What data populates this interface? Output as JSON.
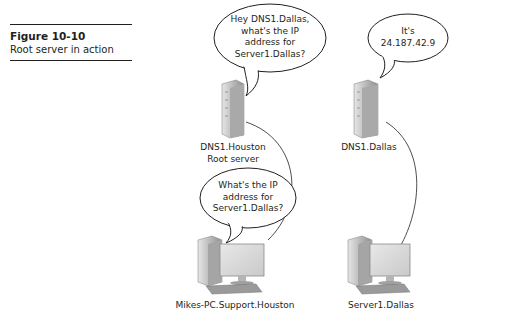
{
  "figure": {
    "number": "Figure 10-10",
    "title": "Root server in action"
  },
  "nodes": {
    "dns_houston": {
      "label_line1": "DNS1.Houston",
      "label_line2": "Root server",
      "type": "server-tower"
    },
    "dns_dallas": {
      "label": "DNS1.Dallas",
      "type": "server-tower"
    },
    "mikes_pc": {
      "label": "Mikes-PC.Support.Houston",
      "type": "desktop-computer"
    },
    "server_dallas": {
      "label": "Server1.Dallas",
      "type": "desktop-computer"
    }
  },
  "bubbles": {
    "houston_query": {
      "lines": [
        "Hey DNS1.Dallas,",
        "what's the IP",
        "address for",
        "Server1.Dallas?"
      ]
    },
    "dallas_reply": {
      "lines": [
        "It's",
        "24.187.42.9"
      ]
    },
    "pc_query": {
      "lines": [
        "What's the IP",
        "address for",
        "Server1.Dallas?"
      ]
    }
  },
  "colors": {
    "ink": "#231f20",
    "device_fill": "#c8c8c8",
    "device_dark": "#8a8a8a",
    "screen": "#dcdcdc"
  }
}
